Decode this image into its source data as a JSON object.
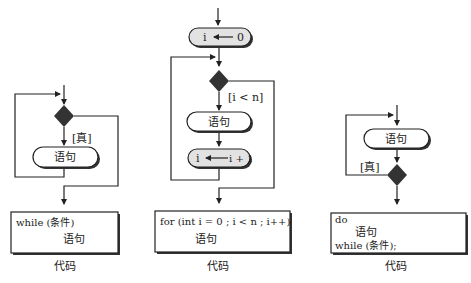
{
  "diagrams": [
    {
      "name": "while-loop",
      "condition_label": "[真]",
      "statement": "语句",
      "code_lines": [
        "while (条件)",
        "语句"
      ],
      "caption": "代码"
    },
    {
      "name": "for-loop",
      "init": {
        "var": "i",
        "value": "0"
      },
      "condition_label": "[i < n]",
      "statement": "语句",
      "update": {
        "var": "i",
        "value": "i + 1"
      },
      "code_lines": [
        "for (int i = 0 ; i  <  n  ; i++)",
        "语句"
      ],
      "caption": "代码"
    },
    {
      "name": "do-while-loop",
      "condition_label": "[真]",
      "statement": "语句",
      "code_lines": [
        "do",
        "语句",
        "while (条件);"
      ],
      "caption": "代码"
    }
  ]
}
